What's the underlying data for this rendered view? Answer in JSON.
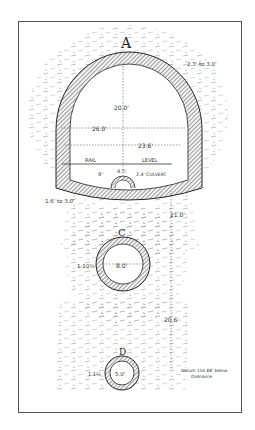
{
  "diagram": {
    "type": "engineering cross-section",
    "sections": [
      {
        "id": "A",
        "label": "A",
        "shape": "horseshoe tunnel",
        "dimensions": {
          "lining_thickness": "2.3' to 3.0'",
          "height": "20.0'",
          "width_max": "26.0'",
          "width_at_springing": "23.6'",
          "invert_thickness": "1.6' to 3.0'"
        },
        "rail_level_label": [
          "RAIL",
          "LEVEL"
        ],
        "culvert": {
          "label": "2.4' CULVERT",
          "offset": "4.5'",
          "radius_note": "9'"
        }
      },
      {
        "id": "C",
        "label": "C",
        "shape": "circular tube",
        "dimensions": {
          "inner_diameter": "8.0'",
          "lining": "1.10½"
        }
      },
      {
        "id": "D",
        "label": "D",
        "shape": "circular tube",
        "dimensions": {
          "inner_diameter": "5.0'",
          "lining": "1.1½"
        }
      }
    ],
    "vertical_spacing": {
      "A_to_C": "21.0'",
      "C_to_D": "20.6'"
    },
    "datum_note": [
      "Datum 154.68' below",
      "Ordnance"
    ]
  },
  "colors": {
    "ink": "#333333",
    "frame": "#555555",
    "background": "#ffffff",
    "hatch": "#444444",
    "earth": "#888888"
  }
}
